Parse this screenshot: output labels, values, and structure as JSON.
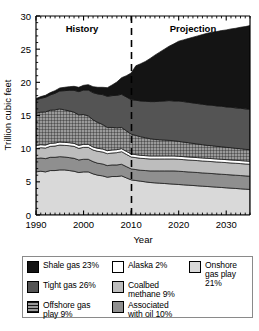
{
  "chart_data": {
    "type": "area",
    "title": "",
    "xlabel": "Year",
    "ylabel": "Trillion cubic feet",
    "xlim": [
      1990,
      2035
    ],
    "ylim": [
      0,
      30
    ],
    "xticks": [
      1990,
      2000,
      2010,
      2020,
      2030
    ],
    "yticks": [
      0,
      5,
      10,
      15,
      20,
      25,
      30
    ],
    "grid": false,
    "legend_position": "below-plot",
    "stacked": true,
    "annotations": [
      {
        "text": "History",
        "x": 1999,
        "y": 28.2
      },
      {
        "text": "Projection",
        "x": 2022,
        "y": 28.2
      },
      {
        "text": "divider",
        "x": 2010,
        "style": "dashed-vertical"
      }
    ],
    "x": [
      1990,
      1991,
      1992,
      1993,
      1994,
      1995,
      1996,
      1997,
      1998,
      1999,
      2000,
      2001,
      2002,
      2003,
      2004,
      2005,
      2006,
      2007,
      2008,
      2009,
      2010,
      2011,
      2012,
      2013,
      2014,
      2015,
      2016,
      2017,
      2018,
      2019,
      2020,
      2021,
      2022,
      2023,
      2024,
      2025,
      2026,
      2027,
      2028,
      2029,
      2030,
      2031,
      2032,
      2033,
      2034,
      2035
    ],
    "series": [
      {
        "name": "Onshore gas play 21%",
        "color": "#d9d9d9",
        "pattern": "solid",
        "values": [
          6.5,
          6.6,
          6.5,
          6.7,
          6.7,
          6.8,
          6.8,
          6.7,
          6.6,
          6.4,
          6.5,
          6.5,
          6.2,
          6.0,
          5.9,
          5.7,
          5.8,
          5.8,
          5.9,
          5.6,
          5.3,
          5.2,
          5.1,
          5.0,
          4.9,
          4.85,
          4.8,
          4.75,
          4.7,
          4.65,
          4.6,
          4.55,
          4.5,
          4.45,
          4.4,
          4.35,
          4.3,
          4.25,
          4.2,
          4.15,
          4.1,
          4.05,
          4.0,
          3.95,
          3.9,
          3.85
        ]
      },
      {
        "name": "Associated with oil 10%",
        "color": "#8f8f8f",
        "pattern": "solid",
        "values": [
          2.0,
          2.0,
          2.0,
          2.0,
          2.0,
          2.0,
          1.95,
          1.95,
          1.95,
          1.9,
          1.9,
          1.9,
          1.85,
          1.8,
          1.8,
          1.75,
          1.75,
          1.75,
          1.75,
          1.7,
          1.65,
          1.65,
          1.65,
          1.7,
          1.75,
          1.8,
          1.85,
          1.9,
          1.95,
          2.0,
          2.0,
          2.0,
          2.0,
          2.0,
          2.0,
          2.0,
          2.0,
          2.0,
          2.0,
          2.0,
          2.0,
          2.0,
          2.0,
          2.0,
          2.0,
          2.0
        ]
      },
      {
        "name": "Coalbed methane 9%",
        "color": "#bdbdbd",
        "pattern": "solid",
        "values": [
          1.5,
          1.55,
          1.6,
          1.65,
          1.7,
          1.75,
          1.75,
          1.8,
          1.8,
          1.75,
          1.8,
          1.8,
          1.75,
          1.8,
          1.8,
          1.8,
          1.8,
          1.85,
          1.9,
          1.85,
          1.8,
          1.8,
          1.8,
          1.8,
          1.8,
          1.8,
          1.8,
          1.8,
          1.8,
          1.8,
          1.8,
          1.8,
          1.8,
          1.8,
          1.8,
          1.8,
          1.8,
          1.8,
          1.8,
          1.8,
          1.8,
          1.8,
          1.8,
          1.8,
          1.8,
          1.8
        ]
      },
      {
        "name": "Alaska 2%",
        "color": "#ffffff",
        "pattern": "solid",
        "values": [
          0.45,
          0.45,
          0.45,
          0.45,
          0.45,
          0.45,
          0.45,
          0.45,
          0.45,
          0.45,
          0.45,
          0.45,
          0.45,
          0.45,
          0.45,
          0.45,
          0.45,
          0.45,
          0.45,
          0.45,
          0.45,
          0.45,
          0.45,
          0.45,
          0.45,
          0.45,
          0.45,
          0.45,
          0.45,
          0.45,
          0.45,
          0.45,
          0.45,
          0.45,
          0.45,
          0.45,
          0.45,
          0.45,
          0.45,
          0.45,
          0.45,
          0.45,
          0.45,
          0.45,
          0.45,
          0.45
        ]
      },
      {
        "name": "Offshore gas play 9%",
        "color": "#8c8c8c",
        "pattern": "crosshatch",
        "values": [
          4.9,
          4.9,
          5.0,
          5.0,
          5.0,
          5.0,
          4.9,
          4.8,
          4.7,
          4.6,
          4.5,
          4.3,
          4.1,
          3.9,
          3.7,
          3.5,
          3.4,
          3.3,
          3.2,
          3.1,
          3.0,
          2.9,
          2.8,
          2.7,
          2.6,
          2.5,
          2.45,
          2.4,
          2.35,
          2.3,
          2.25,
          2.2,
          2.15,
          2.1,
          2.05,
          2.0,
          1.95,
          1.95,
          1.9,
          1.9,
          1.85,
          1.85,
          1.8,
          1.8,
          1.75,
          1.75
        ]
      },
      {
        "name": "Tight gas 26%",
        "color": "#545454",
        "pattern": "solid",
        "values": [
          2.0,
          2.1,
          2.2,
          2.3,
          2.5,
          2.7,
          2.9,
          3.1,
          3.3,
          3.5,
          3.7,
          3.9,
          4.1,
          4.3,
          4.5,
          4.7,
          4.8,
          4.9,
          5.0,
          5.1,
          5.2,
          5.3,
          5.4,
          5.5,
          5.6,
          5.7,
          5.8,
          5.9,
          6.0,
          6.0,
          6.1,
          6.1,
          6.1,
          6.1,
          6.1,
          6.1,
          6.1,
          6.1,
          6.1,
          6.1,
          6.1,
          6.1,
          6.1,
          6.1,
          6.1,
          6.1
        ]
      },
      {
        "name": "Shale gas 23%",
        "color": "#141414",
        "pattern": "solid",
        "values": [
          0.2,
          0.25,
          0.3,
          0.35,
          0.4,
          0.45,
          0.5,
          0.55,
          0.6,
          0.65,
          0.7,
          0.8,
          0.9,
          1.0,
          1.1,
          1.3,
          1.6,
          2.0,
          2.5,
          3.2,
          4.0,
          5.2,
          5.6,
          6.0,
          6.5,
          7.0,
          7.4,
          7.8,
          8.2,
          8.6,
          9.0,
          9.3,
          9.6,
          9.9,
          10.2,
          10.5,
          10.8,
          11.0,
          11.2,
          11.4,
          11.6,
          11.8,
          12.0,
          12.2,
          12.4,
          12.6
        ]
      }
    ]
  },
  "axes": {
    "ylabel": "Trillion cubic feet",
    "xlabel": "Year",
    "ytick_labels": [
      "0",
      "5",
      "10",
      "15",
      "20",
      "25",
      "30"
    ],
    "xtick_labels": [
      "1990",
      "2000",
      "2010",
      "2020",
      "2030"
    ]
  },
  "annotations": {
    "history": "History",
    "projection": "Projection"
  },
  "legend": {
    "col1": [
      {
        "label": "Shale gas 23%",
        "color": "#141414",
        "pattern": "solid"
      },
      {
        "label": "Tight gas 26%",
        "color": "#545454",
        "pattern": "solid"
      },
      {
        "label": "Offshore gas\nplay 9%",
        "color": "#8c8c8c",
        "pattern": "crosshatch"
      }
    ],
    "col2": [
      {
        "label": "Alaska 2%",
        "color": "#ffffff",
        "pattern": "solid"
      },
      {
        "label": "Coalbed\nmethane 9%",
        "color": "#bdbdbd",
        "pattern": "solid"
      },
      {
        "label": "Associated\nwith oil 10%",
        "color": "#8f8f8f",
        "pattern": "solid"
      }
    ],
    "col3": [
      {
        "label": "Onshore\ngas play 21%",
        "color": "#d9d9d9",
        "pattern": "solid"
      }
    ]
  }
}
